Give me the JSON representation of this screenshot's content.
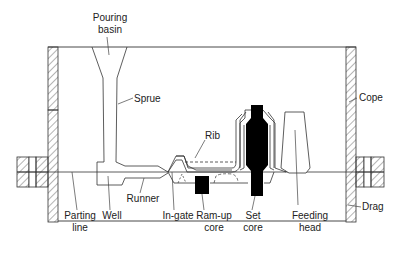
{
  "figure": {
    "colors": {
      "line": "#333333",
      "core_fill": "#000000",
      "background": "#ffffff"
    }
  },
  "labels": {
    "pouring_basin": [
      "Pouring",
      "basin"
    ],
    "sprue": "Sprue",
    "cope": "Cope",
    "rib": "Rib",
    "drag": "Drag",
    "parting_line": [
      "Parting",
      "line"
    ],
    "well": "Well",
    "runner": "Runner",
    "in_gate": "In-gate",
    "ram_up_core": [
      "Ram-up",
      "core"
    ],
    "set_core": [
      "Set",
      "core"
    ],
    "feeding_head": [
      "Feeding",
      "head"
    ]
  }
}
